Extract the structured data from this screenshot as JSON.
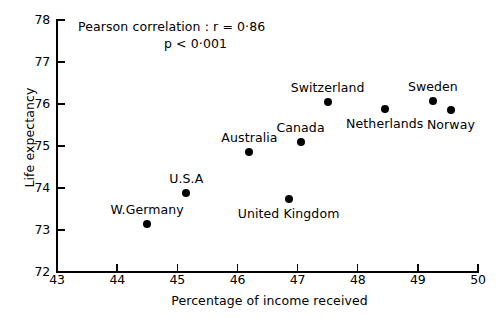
{
  "chart_data": {
    "type": "scatter",
    "title": "",
    "xlabel": "Percentage of income received",
    "ylabel": "Life expectancy",
    "xlim": [
      43,
      50
    ],
    "ylim": [
      72,
      78
    ],
    "xticks": [
      43,
      44,
      45,
      46,
      47,
      48,
      49,
      50
    ],
    "yticks": [
      72,
      73,
      74,
      75,
      76,
      77,
      78
    ],
    "grid": false,
    "legend": "none",
    "annotations": [
      "Pearson correlation : r = 0·86",
      "p < 0·001"
    ],
    "stats": {
      "pearson_r": 0.86,
      "p_value": "<0.001"
    },
    "points": [
      {
        "label": "W.Germany",
        "x": 44.5,
        "y": 73.15,
        "label_pos": "above"
      },
      {
        "label": "U.S.A",
        "x": 45.15,
        "y": 73.87,
        "label_pos": "above"
      },
      {
        "label": "Australia",
        "x": 46.2,
        "y": 74.85,
        "label_pos": "above"
      },
      {
        "label": "United Kingdom",
        "x": 46.85,
        "y": 73.75,
        "label_pos": "below"
      },
      {
        "label": "Canada",
        "x": 47.05,
        "y": 75.1,
        "label_pos": "above"
      },
      {
        "label": "Switzerland",
        "x": 47.5,
        "y": 76.05,
        "label_pos": "above"
      },
      {
        "label": "Netherlands",
        "x": 48.45,
        "y": 75.87,
        "label_pos": "below"
      },
      {
        "label": "Sweden",
        "x": 49.25,
        "y": 76.07,
        "label_pos": "above"
      },
      {
        "label": "Norway",
        "x": 49.55,
        "y": 75.85,
        "label_pos": "below"
      }
    ]
  }
}
